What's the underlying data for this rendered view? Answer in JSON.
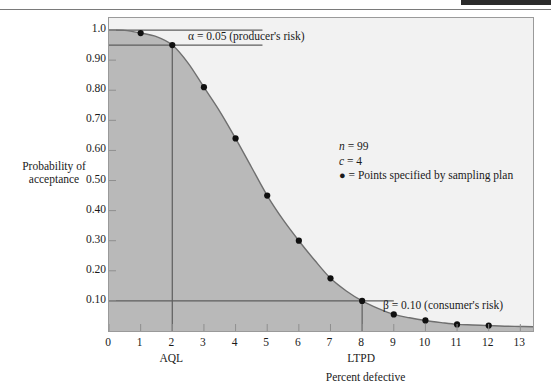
{
  "chart_data": {
    "type": "line",
    "title": "",
    "subtitle": "",
    "xlabel": "Percent defective",
    "ylabel": "Probability of acceptance",
    "ylabel_line1": "Probability of",
    "ylabel_line2": "acceptance",
    "xlim": [
      0,
      13.4
    ],
    "ylim": [
      0,
      1.04
    ],
    "grid": false,
    "x_ticks": [
      "0",
      "1",
      "2",
      "3",
      "4",
      "5",
      "6",
      "7",
      "8",
      "9",
      "10",
      "11",
      "12",
      "13"
    ],
    "x_tick_values": [
      0,
      1,
      2,
      3,
      4,
      5,
      6,
      7,
      8,
      9,
      10,
      11,
      12,
      13
    ],
    "y_ticks": [
      "0.10",
      "0.20",
      "0.30",
      "0.40",
      "0.50",
      "0.60",
      "0.70",
      "0.80",
      "0.90",
      "1.0"
    ],
    "y_tick_values": [
      0.1,
      0.2,
      0.3,
      0.4,
      0.5,
      0.6,
      0.7,
      0.8,
      0.9,
      1.0
    ],
    "series": [
      {
        "name": "OC curve (operating characteristic)",
        "x": [
          0,
          0.5,
          1,
          1.5,
          2,
          2.5,
          3,
          3.5,
          4,
          4.5,
          5,
          5.5,
          6,
          6.5,
          7,
          7.5,
          8,
          8.5,
          9,
          9.5,
          10,
          10.5,
          11,
          11.5,
          12,
          12.5,
          13,
          13.4
        ],
        "y": [
          1.0,
          0.999,
          0.99,
          0.978,
          0.95,
          0.89,
          0.81,
          0.73,
          0.64,
          0.545,
          0.45,
          0.37,
          0.3,
          0.235,
          0.175,
          0.133,
          0.1,
          0.075,
          0.055,
          0.044,
          0.035,
          0.028,
          0.022,
          0.02,
          0.018,
          0.016,
          0.015,
          0.014
        ]
      }
    ],
    "points": {
      "label": "= Points specified by sampling plan",
      "x": [
        1,
        2,
        3,
        4,
        5,
        6,
        7,
        8,
        9,
        10,
        11,
        12
      ],
      "y": [
        0.99,
        0.95,
        0.81,
        0.64,
        0.45,
        0.3,
        0.175,
        0.1,
        0.055,
        0.035,
        0.022,
        0.018
      ]
    },
    "reference_lines": [
      {
        "name": "alpha-top-line",
        "type": "horizontal",
        "y": 1.0,
        "x_from": 0,
        "x_to": 4.85
      },
      {
        "name": "alpha-line",
        "type": "horizontal",
        "y": 0.95,
        "x_from": 0,
        "x_to": 4.85
      },
      {
        "name": "aql-line",
        "type": "vertical",
        "x": 2,
        "y_from": 0,
        "y_to": 0.95
      },
      {
        "name": "beta-line",
        "type": "horizontal",
        "y": 0.1,
        "x_from": 0,
        "x_to": 9.0
      },
      {
        "name": "ltpd-line",
        "type": "vertical",
        "x": 8,
        "y_from": 0,
        "y_to": 0.1
      }
    ],
    "axis_markers": [
      {
        "label": "AQL",
        "x": 2
      },
      {
        "label": "LTPD",
        "x": 8
      }
    ],
    "annotations": [
      {
        "name": "alpha",
        "text": "α = 0.05 (producer's risk)"
      },
      {
        "name": "beta",
        "text": "β = 0.10 (consumer's risk)"
      }
    ],
    "legend": {
      "position": "inside-right",
      "n_label": "n",
      "n_value": "= 99",
      "c_label": "c",
      "c_value": "= 4",
      "dot_glyph": "●",
      "points_text": "= Points specified by sampling plan"
    },
    "colors": {
      "area_below_curve": "#b9b9b9",
      "area_above_curve": "#f2f2f2",
      "curve": "#6f6f6f",
      "point": "#101010",
      "reference_line": "#5e5e5e",
      "axis": "#8f8f8f",
      "text": "#1a1a1a"
    }
  }
}
